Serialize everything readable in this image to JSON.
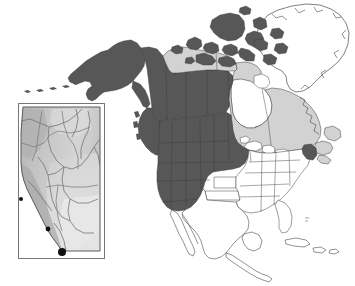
{
  "figure": {
    "width": 355,
    "height": 286,
    "background_color": "#ffffff"
  },
  "legend_tones": {
    "shaded_dark_label": "Dark shaded region",
    "shaded_dark_color": "#575757",
    "shaded_light_label": "Light shaded region",
    "shaded_light_color": "#d2d2d2",
    "unshaded_label": "Unshaded region",
    "unshaded_color": "#ffffff",
    "outline_color": "#4a4a4a",
    "marker_color": "#111111"
  },
  "main_map": {
    "name": "north-america",
    "regions": [
      {
        "id": "alaska",
        "label": "Alaska",
        "tone": "dark"
      },
      {
        "id": "yukon",
        "label": "Yukon",
        "tone": "dark"
      },
      {
        "id": "british-columbia",
        "label": "British Columbia",
        "tone": "dark"
      },
      {
        "id": "alberta",
        "label": "Alberta",
        "tone": "dark"
      },
      {
        "id": "saskatchewan",
        "label": "Saskatchewan",
        "tone": "dark"
      },
      {
        "id": "manitoba",
        "label": "Manitoba",
        "tone": "dark"
      },
      {
        "id": "northwest-territories",
        "label": "Northwest Territories",
        "tone": "light"
      },
      {
        "id": "nunavut-mainland",
        "label": "Nunavut mainland",
        "tone": "light"
      },
      {
        "id": "arctic-islands",
        "label": "Canadian Arctic Archipelago",
        "tone": "dark"
      },
      {
        "id": "ontario",
        "label": "Ontario",
        "tone": "light"
      },
      {
        "id": "quebec",
        "label": "Quebec",
        "tone": "light"
      },
      {
        "id": "atlantic-provinces",
        "label": "Atlantic provinces",
        "tone": "light"
      },
      {
        "id": "greenland",
        "label": "Greenland",
        "tone": "unshaded"
      },
      {
        "id": "western-united-states",
        "label": "Western United States",
        "tone": "dark"
      },
      {
        "id": "eastern-united-states",
        "label": "Eastern United States",
        "tone": "unshaded"
      },
      {
        "id": "maine",
        "label": "Maine",
        "tone": "dark"
      },
      {
        "id": "mexico",
        "label": "Mexico",
        "tone": "unshaded"
      },
      {
        "id": "central-america",
        "label": "Central America",
        "tone": "unshaded"
      },
      {
        "id": "caribbean",
        "label": "Caribbean islands",
        "tone": "unshaded"
      },
      {
        "id": "hudson-bay",
        "label": "Hudson Bay",
        "tone": "unshaded"
      }
    ]
  },
  "inset_map": {
    "name": "alberta-inset",
    "region_label": "Alberta",
    "frame_color": "#777777",
    "fill_tone": "#c9c9c9",
    "relief_label": "Shaded terrain relief",
    "rivers_label": "River network",
    "markers": [
      {
        "id": "site-marker",
        "label": "Study site",
        "x_pct": 51,
        "y_pct": 96
      },
      {
        "id": "border-marker-mid",
        "label": "Boundary point",
        "x_pct": 41,
        "y_pct": 80
      },
      {
        "id": "border-marker-upper",
        "label": "Boundary point",
        "x_pct": 2,
        "y_pct": 62
      }
    ]
  }
}
